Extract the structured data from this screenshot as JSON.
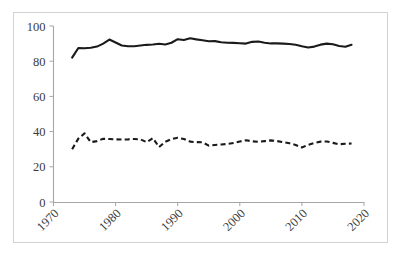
{
  "chart_data": {
    "type": "line",
    "title": "",
    "subtitle": "",
    "xlabel": "",
    "ylabel": "",
    "xlim": [
      1970,
      2020
    ],
    "ylim": [
      0,
      100
    ],
    "grid": false,
    "legend": "none",
    "x_ticks": [
      "1970",
      "1980",
      "1990",
      "2000",
      "2010",
      "2020"
    ],
    "x_tick_values": [
      1970,
      1980,
      1990,
      2000,
      2010,
      2020
    ],
    "y_ticks": [
      "0",
      "20",
      "40",
      "60",
      "80",
      "100"
    ],
    "y_tick_values": [
      0,
      20,
      40,
      60,
      80,
      100
    ],
    "x": [
      1973,
      1974,
      1975,
      1976,
      1977,
      1978,
      1979,
      1980,
      1981,
      1982,
      1983,
      1984,
      1985,
      1986,
      1987,
      1988,
      1989,
      1990,
      1991,
      1992,
      1993,
      1994,
      1995,
      1996,
      1997,
      1998,
      1999,
      2000,
      2001,
      2002,
      2003,
      2004,
      2005,
      2006,
      2007,
      2008,
      2009,
      2010,
      2011,
      2012,
      2013,
      2014,
      2015,
      2016,
      2017,
      2018
    ],
    "series": [
      {
        "name": "solid-series",
        "style": "solid",
        "color": "#1a1a1a",
        "values": [
          82.0,
          87.5,
          87.4,
          87.6,
          88.3,
          90.0,
          92.3,
          90.6,
          88.9,
          88.5,
          88.5,
          88.9,
          89.3,
          89.5,
          89.9,
          89.5,
          90.5,
          92.5,
          92.0,
          93.0,
          92.4,
          91.9,
          91.3,
          91.4,
          90.8,
          90.5,
          90.4,
          90.2,
          90.0,
          91.0,
          91.2,
          90.5,
          90.1,
          90.1,
          90.0,
          89.8,
          89.3,
          88.5,
          87.8,
          88.3,
          89.4,
          90.0,
          89.6,
          88.6,
          88.2,
          89.3
        ]
      },
      {
        "name": "dashed-series",
        "style": "dashed",
        "color": "#1a1a1a",
        "values": [
          30.0,
          36.0,
          39.0,
          34.0,
          34.6,
          35.9,
          35.8,
          35.6,
          35.5,
          35.6,
          35.8,
          35.6,
          34.0,
          36.3,
          31.2,
          34.2,
          35.7,
          36.5,
          35.8,
          34.3,
          34.0,
          33.9,
          32.0,
          32.4,
          32.7,
          33.0,
          33.5,
          34.4,
          35.1,
          34.5,
          34.2,
          34.6,
          35.0,
          34.6,
          34.0,
          33.4,
          32.4,
          31.0,
          32.5,
          33.6,
          34.3,
          34.4,
          33.6,
          32.8,
          33.1,
          33.2
        ]
      }
    ]
  },
  "figure": {
    "background_color": "#ffffff",
    "border_color": "#d2d2d2",
    "axis_color": "#a6a6a6",
    "tick_label_color": "#3a3a3a"
  }
}
